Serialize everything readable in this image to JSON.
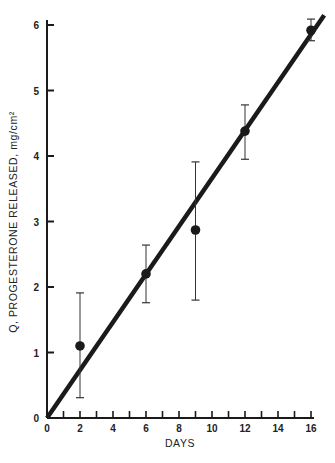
{
  "chart_data": {
    "type": "scatter",
    "title": "",
    "xlabel": "DAYS",
    "ylabel": "Q, PROGESTERONE RELEASED, mg/cm²",
    "xlim": [
      0,
      16
    ],
    "ylim": [
      0,
      6
    ],
    "x_ticks": [
      0,
      2,
      4,
      6,
      8,
      10,
      12,
      14,
      16
    ],
    "x_minor_ticks": [
      1,
      3,
      5,
      7,
      9,
      11,
      13,
      15
    ],
    "y_ticks": [
      0,
      1,
      2,
      3,
      4,
      5,
      6
    ],
    "grid": false,
    "legend": null,
    "series": [
      {
        "name": "Measured release",
        "marker": "filled-circle",
        "points": [
          {
            "x": 2,
            "y": 1.1,
            "err_low": 0.31,
            "err_high": 1.91
          },
          {
            "x": 6,
            "y": 2.2,
            "err_low": 1.76,
            "err_high": 2.64
          },
          {
            "x": 9,
            "y": 2.87,
            "err_low": 1.8,
            "err_high": 3.91
          },
          {
            "x": 12,
            "y": 4.38,
            "err_low": 3.95,
            "err_high": 4.78
          },
          {
            "x": 16,
            "y": 5.92,
            "err_low": 5.76,
            "err_high": 6.09
          }
        ]
      },
      {
        "name": "Linear fit",
        "type": "line",
        "x": [
          0,
          16.8
        ],
        "y": [
          0,
          6.15
        ]
      }
    ],
    "colors": {
      "ink": "#1a1a1a",
      "background": "#ffffff"
    }
  },
  "labels": {
    "x_axis_title": "DAYS",
    "y_axis_title": "Q, PROGESTERONE RELEASED, mg/cm²"
  }
}
